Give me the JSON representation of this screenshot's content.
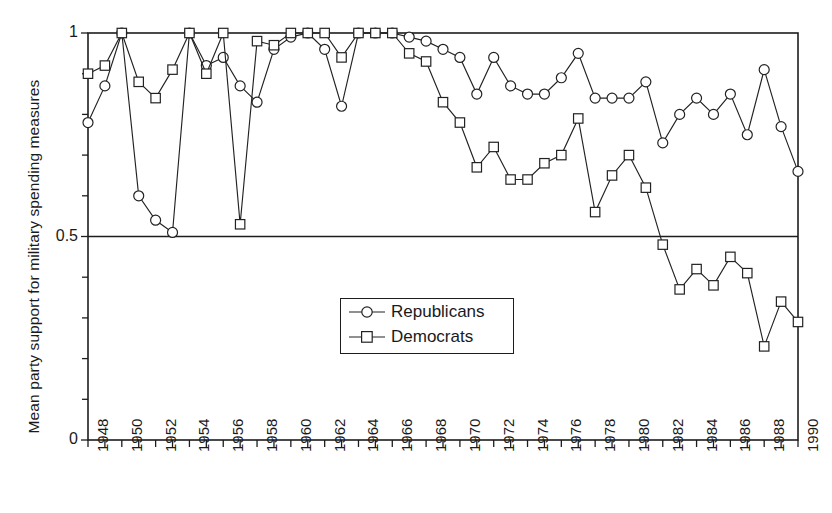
{
  "figure": {
    "title": "",
    "y_axis_label": "Mean party support for military spending measures",
    "y_tick_labels": [
      "1",
      "0.5",
      "0"
    ],
    "x_tick_labels": [
      "1948",
      "1950",
      "1952",
      "1954",
      "1956",
      "1958",
      "1960",
      "1962",
      "1964",
      "1966",
      "1968",
      "1970",
      "1972",
      "1974",
      "1976",
      "1978",
      "1980",
      "1982",
      "1984",
      "1986",
      "1988",
      "1990"
    ],
    "legend": {
      "entries": [
        {
          "label": "Republicans",
          "marker": "circle-marker"
        },
        {
          "label": "Democrats",
          "marker": "square-marker"
        }
      ]
    },
    "colors": {
      "line": "#222222",
      "axis": "#1d1d1d",
      "background": "#ffffff",
      "marker_fill": "#ffffff"
    }
  },
  "chart_data": {
    "type": "line",
    "title": "",
    "xlabel": "",
    "ylabel": "Mean party support for military spending measures",
    "xlim": [
      1948,
      1990
    ],
    "ylim": [
      0,
      1
    ],
    "yticks": [
      0,
      0.5,
      1
    ],
    "ytick_labels": [
      "0",
      "0.5",
      "1"
    ],
    "yminor_tick_step": 0.1,
    "xticks": [
      1948,
      1949,
      1950,
      1951,
      1952,
      1953,
      1954,
      1955,
      1956,
      1957,
      1958,
      1959,
      1960,
      1961,
      1962,
      1963,
      1964,
      1965,
      1966,
      1967,
      1968,
      1969,
      1970,
      1971,
      1972,
      1973,
      1974,
      1975,
      1976,
      1977,
      1978,
      1979,
      1980,
      1981,
      1982,
      1983,
      1984,
      1985,
      1986,
      1987,
      1988,
      1989,
      1990
    ],
    "xtick_labels_every": 2,
    "grid": false,
    "gridlines_drawn": [
      "y=0.5",
      "y=1.0"
    ],
    "legend_position": "center",
    "x": [
      1948,
      1949,
      1950,
      1951,
      1952,
      1953,
      1954,
      1955,
      1956,
      1957,
      1958,
      1959,
      1960,
      1961,
      1962,
      1963,
      1964,
      1965,
      1966,
      1967,
      1968,
      1969,
      1970,
      1971,
      1972,
      1973,
      1974,
      1975,
      1976,
      1977,
      1978,
      1979,
      1980,
      1981,
      1982,
      1983,
      1984,
      1985,
      1986,
      1987,
      1988,
      1989,
      1990
    ],
    "series": [
      {
        "name": "Republicans",
        "marker": "circle",
        "values": [
          0.78,
          0.87,
          1.0,
          0.6,
          0.54,
          0.51,
          1.0,
          0.92,
          0.94,
          0.87,
          0.83,
          0.96,
          0.99,
          1.0,
          0.96,
          0.82,
          1.0,
          1.0,
          1.0,
          0.99,
          0.98,
          0.96,
          0.94,
          0.85,
          0.94,
          0.87,
          0.85,
          0.85,
          0.89,
          0.95,
          0.84,
          0.84,
          0.84,
          0.88,
          0.73,
          0.8,
          0.84,
          0.8,
          0.85,
          0.75,
          0.91,
          0.77,
          0.66
        ]
      },
      {
        "name": "Democrats",
        "marker": "square",
        "values": [
          0.9,
          0.92,
          1.0,
          0.88,
          0.84,
          0.91,
          1.0,
          0.9,
          1.0,
          0.53,
          0.98,
          0.97,
          1.0,
          1.0,
          1.0,
          0.94,
          1.0,
          1.0,
          1.0,
          0.95,
          0.93,
          0.83,
          0.78,
          0.67,
          0.72,
          0.64,
          0.64,
          0.68,
          0.7,
          0.79,
          0.56,
          0.65,
          0.7,
          0.62,
          0.48,
          0.37,
          0.42,
          0.38,
          0.45,
          0.41,
          0.23,
          0.34,
          0.29
        ]
      }
    ]
  }
}
